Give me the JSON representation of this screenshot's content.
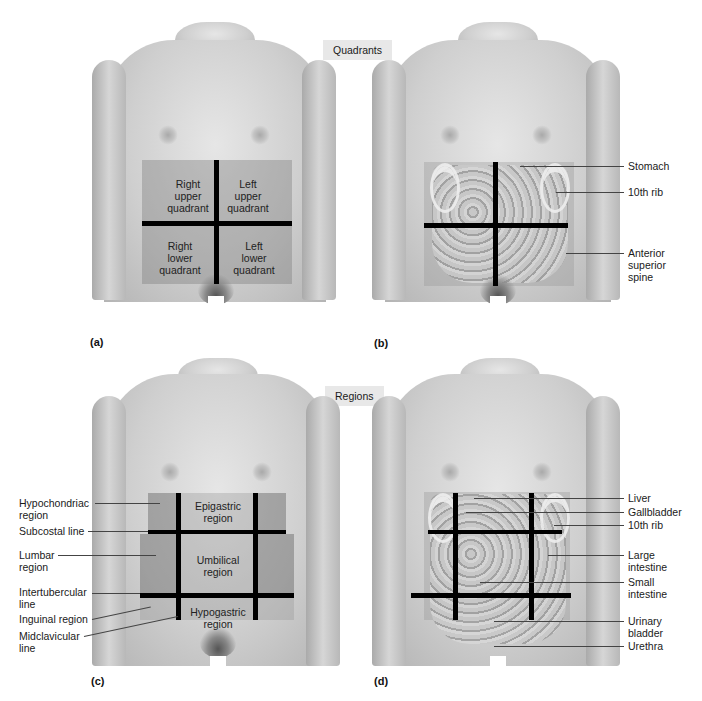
{
  "section_tags": {
    "quadrants": "Quadrants",
    "regions": "Regions"
  },
  "panels": {
    "a": {
      "letter": "(a)",
      "labels": {
        "ruq": "Right upper quadrant",
        "luq": "Left upper quadrant",
        "rlq": "Right lower quadrant",
        "llq": "Left lower quadrant"
      },
      "ruq_lines": [
        "Right",
        "upper",
        "quadrant"
      ],
      "luq_lines": [
        "Left",
        "upper",
        "quadrant"
      ],
      "rlq_lines": [
        "Right",
        "lower",
        "quadrant"
      ],
      "llq_lines": [
        "Left",
        "lower",
        "quadrant"
      ]
    },
    "b": {
      "letter": "(b)",
      "callouts": {
        "stomach": "Stomach",
        "rib10": "10th rib",
        "ass1": "Anterior",
        "ass2": "superior",
        "ass3": "spine"
      }
    },
    "c": {
      "letter": "(c)",
      "region_labels": {
        "epi1": "Epigastric",
        "epi2": "region",
        "umb1": "Umbilical",
        "umb2": "region",
        "hyp1": "Hypogastric",
        "hyp2": "region"
      },
      "callouts": {
        "hypochondriac1": "Hypochondriac",
        "hypochondriac2": "region",
        "subcostal": "Subcostal line",
        "lumbar1": "Lumbar",
        "lumbar2": "region",
        "intertubercular1": "Intertubercular",
        "intertubercular2": "line",
        "inguinal": "Inguinal region",
        "midclavicular1": "Midclavicular",
        "midclavicular2": "line"
      }
    },
    "d": {
      "letter": "(d)",
      "callouts": {
        "liver": "Liver",
        "gallbladder": "Gallbladder",
        "rib10": "10th rib",
        "large1": "Large",
        "large2": "intestine",
        "small1": "Small",
        "small2": "intestine",
        "urinary1": "Urinary",
        "urinary2": "bladder",
        "urethra": "Urethra"
      }
    }
  }
}
